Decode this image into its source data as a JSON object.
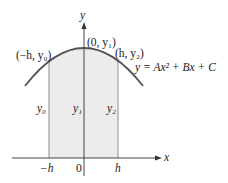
{
  "diagram": {
    "equation": "y = Ax² + Bx + C",
    "axes": {
      "x_label": "x",
      "y_label": "y"
    },
    "points": [
      {
        "label": "(−h, y₀)"
      },
      {
        "label": "(0, y₁)"
      },
      {
        "label": "(h, y₂)"
      }
    ],
    "ordinates": [
      "y₀",
      "y₁",
      "y₂"
    ],
    "ticks": [
      "−h",
      "0",
      "h"
    ],
    "colors": {
      "curve": "#555555",
      "shade": "#ececec",
      "axis": "#333333"
    }
  }
}
